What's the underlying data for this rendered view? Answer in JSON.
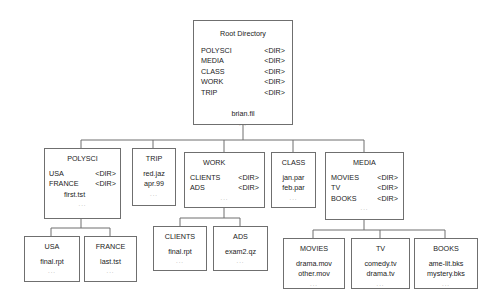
{
  "root": {
    "title": "Root Directory",
    "entries": [
      {
        "name": "POLYSCI",
        "type": "<DIR>"
      },
      {
        "name": "MEDIA",
        "type": "<DIR>"
      },
      {
        "name": "CLASS",
        "type": "<DIR>"
      },
      {
        "name": "WORK",
        "type": "<DIR>"
      },
      {
        "name": "TRIP",
        "type": "<DIR>"
      }
    ],
    "files": [
      "brian.fil"
    ],
    "ellipsis": "..."
  },
  "polysci": {
    "title": "POLYSCI",
    "entries": [
      {
        "name": "USA",
        "type": "<DIR>"
      },
      {
        "name": "FRANCE",
        "type": "<DIR>"
      }
    ],
    "files": [
      "first.tst"
    ],
    "ellipsis": "..."
  },
  "trip": {
    "title": "TRIP",
    "files": [
      "red.jaz",
      "apr.99"
    ],
    "ellipsis": "..."
  },
  "work": {
    "title": "WORK",
    "entries": [
      {
        "name": "CLIENTS",
        "type": "<DIR>"
      },
      {
        "name": "ADS",
        "type": "<DIR>"
      }
    ],
    "ellipsis": "..."
  },
  "class": {
    "title": "CLASS",
    "files": [
      "jan.par",
      "feb.par"
    ],
    "ellipsis": "..."
  },
  "media": {
    "title": "MEDIA",
    "entries": [
      {
        "name": "MOVIES",
        "type": "<DIR>"
      },
      {
        "name": "TV",
        "type": "<DIR>"
      },
      {
        "name": "BOOKS",
        "type": "<DIR>"
      }
    ],
    "ellipsis": "..."
  },
  "usa": {
    "title": "USA",
    "files": [
      "final.rpt"
    ],
    "ellipsis": "..."
  },
  "france": {
    "title": "FRANCE",
    "files": [
      "last.tst"
    ],
    "ellipsis": "..."
  },
  "clients": {
    "title": "CLIENTS",
    "files": [
      "final.rpt"
    ],
    "ellipsis": "..."
  },
  "ads": {
    "title": "ADS",
    "files": [
      "exam2.qz"
    ],
    "ellipsis": "..."
  },
  "movies": {
    "title": "MOVIES",
    "files": [
      "drama.mov",
      "other.mov"
    ],
    "ellipsis": "..."
  },
  "tv": {
    "title": "TV",
    "files": [
      "comedy.tv",
      "drama.tv"
    ],
    "ellipsis": "..."
  },
  "books": {
    "title": "BOOKS",
    "files": [
      "ame-lit.bks",
      "mystery.bks"
    ],
    "ellipsis": "..."
  }
}
